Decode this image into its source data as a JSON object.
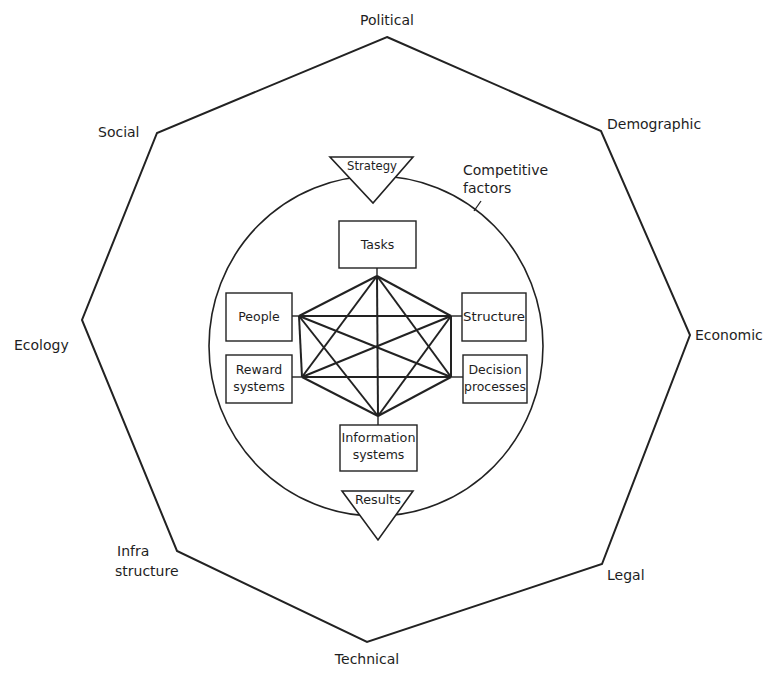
{
  "diagram": {
    "type": "organizational-environment-model",
    "environment_factors": {
      "political": "Political",
      "demographic": "Demographic",
      "economic": "Economic",
      "legal": "Legal",
      "technical": "Technical",
      "infrastructure_line1": "Infra",
      "infrastructure_line2": "structure",
      "ecology": "Ecology",
      "social": "Social"
    },
    "competitive_factors": {
      "line1": "Competitive",
      "line2": "factors"
    },
    "input": "Strategy",
    "output": "Results",
    "elements": {
      "tasks": "Tasks",
      "people": "People",
      "structure": "Structure",
      "reward_line1": "Reward",
      "reward_line2": "systems",
      "decision_line1": "Decision",
      "decision_line2": "processes",
      "information_line1": "Information",
      "information_line2": "systems"
    },
    "connections": "all six elements fully interconnected",
    "colors": {
      "line": "#222222",
      "text": "#1e1e1e",
      "background": "#ffffff"
    }
  }
}
